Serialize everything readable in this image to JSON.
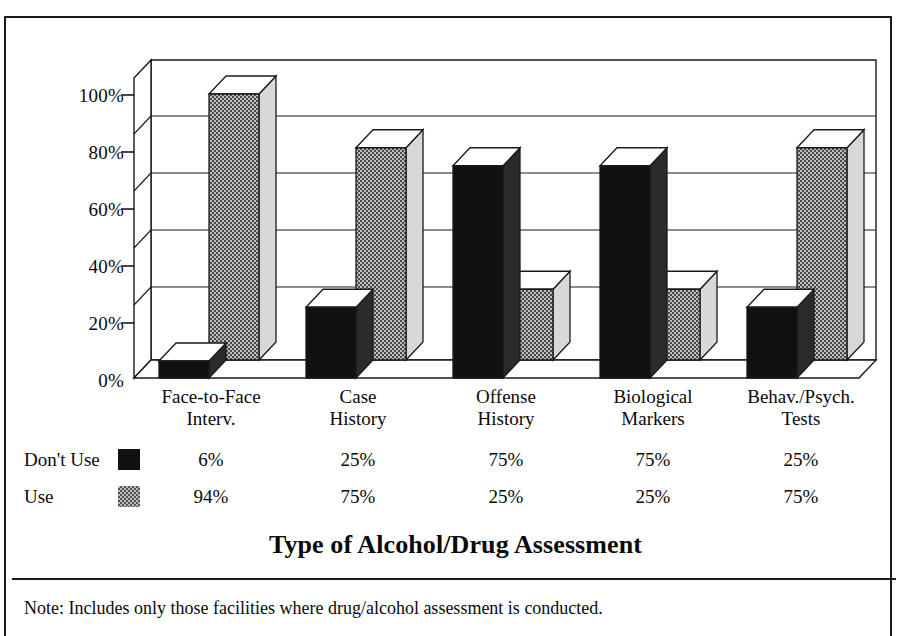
{
  "chart_data": {
    "type": "bar",
    "title": "Type of Alcohol/Drug Assessment",
    "xlabel": "",
    "ylabel": "",
    "ylim": [
      0,
      100
    ],
    "yticks": [
      "0%",
      "20%",
      "40%",
      "60%",
      "80%",
      "100%"
    ],
    "grid": true,
    "legend_position": "below-left",
    "style": "3d-clustered-column",
    "categories": [
      "Face-to-Face Interv.",
      "Case History",
      "Offense History",
      "Biological Markers",
      "Behav./Psych. Tests"
    ],
    "category_lines": [
      [
        "Face-to-Face",
        "Interv."
      ],
      [
        "Case",
        "History"
      ],
      [
        "Offense",
        "History"
      ],
      [
        "Biological",
        "Markers"
      ],
      [
        "Behav./Psych.",
        "Tests"
      ]
    ],
    "series": [
      {
        "name": "Don't Use",
        "swatch": "solid-black",
        "color": "#111111",
        "values": [
          6,
          25,
          75,
          75,
          25
        ],
        "labels": [
          "6%",
          "25%",
          "75%",
          "75%",
          "25%"
        ]
      },
      {
        "name": "Use",
        "swatch": "gray-checker",
        "color": "#b9b9b9",
        "values": [
          94,
          75,
          25,
          25,
          75
        ],
        "labels": [
          "94%",
          "75%",
          "25%",
          "25%",
          "75%"
        ]
      }
    ],
    "note": "Note: Includes only those facilities where drug/alcohol assessment is conducted."
  }
}
